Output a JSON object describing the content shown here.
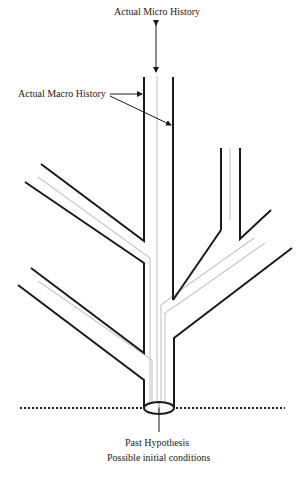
{
  "diagram": {
    "labels": {
      "micro_history": "Actual Micro History",
      "macro_history": "Actual Macro History",
      "past_hypothesis": "Past Hypothesis",
      "initial_conditions": "Possible initial conditions"
    },
    "colors": {
      "macro_line": "#1a1a1a",
      "micro_line": "#c8c8c8",
      "dotted_line": "#1a1a1a",
      "background": "#ffffff"
    },
    "elements": [
      "branching-tube-of-macro-histories",
      "micro-history-thread",
      "past-hypothesis-ellipse",
      "dotted-initial-boundary"
    ]
  }
}
